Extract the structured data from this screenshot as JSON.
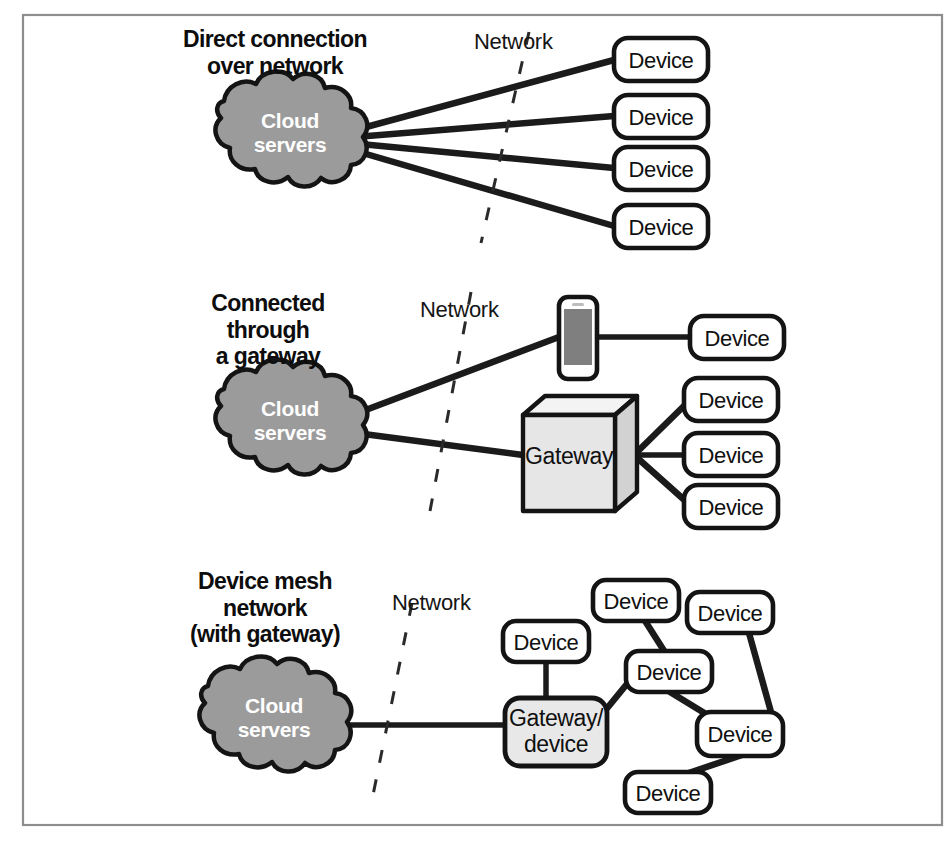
{
  "figure": {
    "frame": {
      "border_color": "#8d8d8d",
      "background": "#ffffff"
    }
  },
  "palette": {
    "cloud_fill": "#9b9b9b",
    "outline": "#141414",
    "gateway_fill": "#e8e8e8",
    "device_fill": "#ffffff",
    "phone_screen": "#7f7f7f",
    "boundary_line": "#2a2a2a"
  },
  "sections": [
    {
      "id": "direct",
      "title": "Direct connection\nover network",
      "network_label": "Network",
      "cloud": {
        "line1": "Cloud",
        "line2": "servers"
      },
      "devices": [
        {
          "label": "Device"
        },
        {
          "label": "Device"
        },
        {
          "label": "Device"
        },
        {
          "label": "Device"
        }
      ]
    },
    {
      "id": "gateway",
      "title": "Connected\nthrough\na gateway",
      "network_label": "Network",
      "cloud": {
        "line1": "Cloud",
        "line2": "servers"
      },
      "phone": {
        "name": "smartphone-gateway"
      },
      "gateway": {
        "label": "Gateway"
      },
      "phone_devices": [
        {
          "label": "Device"
        }
      ],
      "gateway_devices": [
        {
          "label": "Device"
        },
        {
          "label": "Device"
        },
        {
          "label": "Device"
        }
      ]
    },
    {
      "id": "mesh",
      "title": "Device mesh\nnetwork\n(with gateway)",
      "network_label": "Network",
      "cloud": {
        "line1": "Cloud",
        "line2": "servers"
      },
      "gateway": {
        "line1": "Gateway/",
        "line2": "device"
      },
      "mesh_devices": [
        {
          "id": "m1",
          "label": "Device"
        },
        {
          "id": "m2",
          "label": "Device"
        },
        {
          "id": "m3",
          "label": "Device"
        },
        {
          "id": "m4",
          "label": "Device"
        },
        {
          "id": "m5",
          "label": "Device"
        },
        {
          "id": "m6",
          "label": "Device"
        }
      ]
    }
  ]
}
